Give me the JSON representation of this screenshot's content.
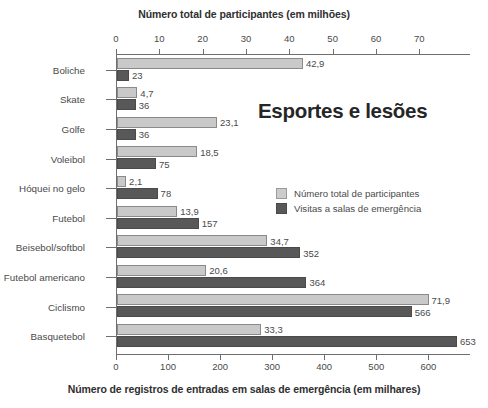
{
  "chart_data": {
    "type": "bar",
    "title": "Esportes e lesões",
    "orientation": "horizontal",
    "grid": false,
    "legend_position": "inside-right",
    "categories": [
      "Boliche",
      "Skate",
      "Golfe",
      "Voleibol",
      "Hóquei no gelo",
      "Futebol",
      "Beisebol/softbol",
      "Futebol americano",
      "Ciclismo",
      "Basquetebol"
    ],
    "series": [
      {
        "name": "Número total de participantes",
        "axis": "top",
        "unit": "milhões",
        "color": "#c9c9c9",
        "values": [
          42.9,
          4.7,
          23.1,
          18.5,
          2.1,
          13.9,
          34.7,
          20.6,
          71.9,
          33.3
        ],
        "labels": [
          "42,9",
          "4,7",
          "23,1",
          "18,5",
          "2,1",
          "13,9",
          "34,7",
          "20,6",
          "71,9",
          "33,3"
        ]
      },
      {
        "name": "Visitas a salas de emergência",
        "axis": "bottom",
        "unit": "milhares",
        "color": "#585858",
        "values": [
          23,
          36,
          36,
          75,
          78,
          157,
          352,
          364,
          566,
          653
        ],
        "labels": [
          "23",
          "36",
          "36",
          "75",
          "78",
          "157",
          "352",
          "364",
          "566",
          "653"
        ]
      }
    ],
    "top_axis": {
      "label": "Número total de participantes (em milhões)",
      "ticks": [
        0,
        10,
        20,
        30,
        40,
        50,
        60,
        70
      ],
      "tick_labels": [
        "0",
        "10",
        "20",
        "30",
        "40",
        "50",
        "60",
        "70"
      ],
      "range": [
        0,
        81.7
      ]
    },
    "bottom_axis": {
      "label": "Número de registros de entradas em salas de emergência (em milhares)",
      "ticks": [
        0,
        100,
        200,
        300,
        400,
        500,
        600
      ],
      "tick_labels": [
        "0",
        "100",
        "200",
        "300",
        "400",
        "500",
        "600"
      ],
      "range": [
        0,
        680
      ]
    },
    "legend": [
      {
        "label": "Número total de participantes",
        "color": "#c9c9c9"
      },
      {
        "label": "Visitas a salas de emergência",
        "color": "#585858"
      }
    ]
  }
}
